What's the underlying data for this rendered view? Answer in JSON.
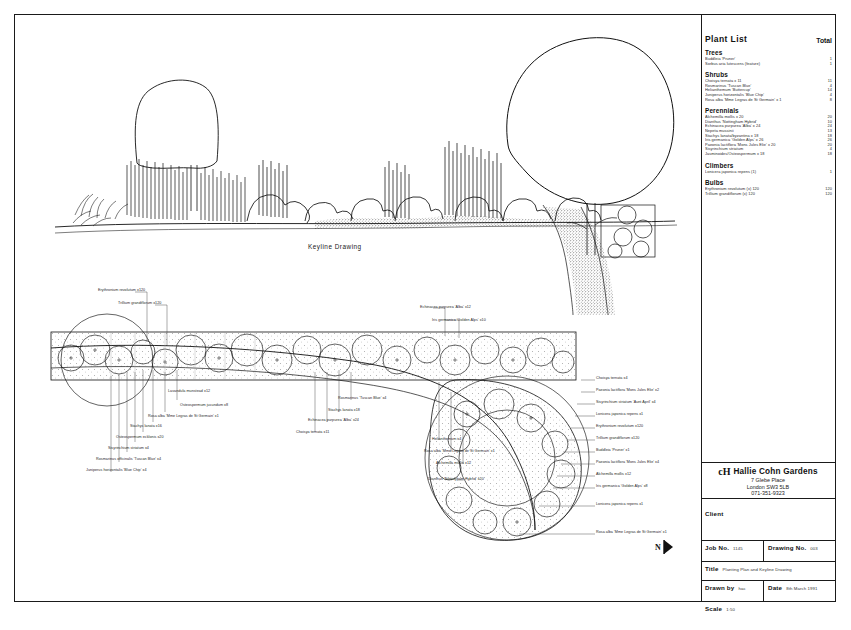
{
  "sheet": {
    "keyline_caption": "Keyline Drawing",
    "bottom_caption": ""
  },
  "plant_list": {
    "title": "Plant List",
    "total_header": "Total",
    "sections": [
      {
        "name": "Trees",
        "rows": [
          {
            "name": "Buddleia 'Pruner'",
            "total": "1"
          },
          {
            "name": "Sorbus aria lutescens (feature)",
            "total": "1"
          }
        ]
      },
      {
        "name": "Shrubs",
        "rows": [
          {
            "name": "Choisya ternata  x 11",
            "total": "11"
          },
          {
            "name": "Rosmarinus 'Tuscan Blue'",
            "total": "4"
          },
          {
            "name": "Helianthemum 'Buttercup'",
            "total": "14"
          },
          {
            "name": "Juniperus horizontalis 'Blue Chip'",
            "total": "4"
          },
          {
            "name": "Rosa alba 'Mme Legras de St Germain' x 1",
            "total": "8"
          }
        ]
      },
      {
        "name": "Perennials",
        "rows": [
          {
            "name": "Alchemilla mollis  x 20",
            "total": "20"
          },
          {
            "name": "Dianthus 'Nottingham Hybrid'",
            "total": "10"
          },
          {
            "name": "Echinacea purpurea 'Alba'  x 24",
            "total": "24"
          },
          {
            "name": "Nepeta mussinii",
            "total": "13"
          },
          {
            "name": "Stachys lanata/byzantina  x 18",
            "total": "18"
          },
          {
            "name": "Iris germanica 'Golden Alps'  x 26",
            "total": "26"
          },
          {
            "name": "Paeonia lactiflora 'Mons Jules Elie'  x 20",
            "total": "20"
          },
          {
            "name": "Sisyrinchium striatum",
            "total": "4"
          },
          {
            "name": "Jasminoides/Osteospermum  x 18",
            "total": "18"
          }
        ]
      },
      {
        "name": "Climbers",
        "rows": [
          {
            "name": "Lonicera japonica repens (1)",
            "total": "1"
          }
        ]
      },
      {
        "name": "Bulbs",
        "rows": [
          {
            "name": "Erythronium revolutum  (x) 120",
            "total": "120"
          },
          {
            "name": "Trillium grandiflorum  (x) 120",
            "total": "120"
          }
        ]
      }
    ]
  },
  "title_block": {
    "company_mark": "cH",
    "company_name": "Hallie Cohn Gardens",
    "address_line1": "7 Glebe Place",
    "address_line2": "London  SW3 5LB",
    "address_line3": "071-351-9323",
    "client_label": "Client",
    "client_value": "",
    "job_no_label": "Job No.",
    "job_no_value": "1145",
    "drawing_no_label": "Drawing No.",
    "drawing_no_value": "003",
    "title_label": "Title",
    "title_value": "Planting Plan and Keyline Drawing",
    "drawn_by_label": "Drawn by",
    "drawn_by_value": "hac",
    "date_label": "Date",
    "date_value": "8th March 1991",
    "scale_label": "Scale",
    "scale_value": "1:50"
  },
  "north_arrow": {
    "label": "N"
  },
  "plan_annotations": [
    {
      "id": "a01",
      "text": "Erythronium revolutum x120",
      "x": 98,
      "y": 288
    },
    {
      "id": "a02",
      "text": "Trillium grandiflorum x120",
      "x": 118,
      "y": 301
    },
    {
      "id": "a03",
      "text": "Echinacea purpurea 'Alba' x12",
      "x": 420,
      "y": 305
    },
    {
      "id": "a04",
      "text": "Iris germanica 'Golden Alps' x10",
      "x": 432,
      "y": 318
    },
    {
      "id": "a05",
      "text": "Lavandula munstead x12",
      "x": 168,
      "y": 389
    },
    {
      "id": "a06",
      "text": "Osteospermum jucundum x8",
      "x": 180,
      "y": 403
    },
    {
      "id": "a07",
      "text": "Rosa alba 'Mme Legras de St Germain' x1",
      "x": 148,
      "y": 414
    },
    {
      "id": "a08",
      "text": "Stachys lanata x16",
      "x": 130,
      "y": 424
    },
    {
      "id": "a09",
      "text": "Osteospermum ecklonis x20",
      "x": 116,
      "y": 435
    },
    {
      "id": "a10",
      "text": "Sisyrinchium striatum x4",
      "x": 108,
      "y": 446
    },
    {
      "id": "a11",
      "text": "Rosmarinus officinalis 'Tuscan Blue' x4",
      "x": 96,
      "y": 457
    },
    {
      "id": "a12",
      "text": "Juniperus horizontalis 'Blue Chip' x4",
      "x": 86,
      "y": 468
    },
    {
      "id": "a13",
      "text": "Rosmarinus 'Tuscan Blue' x4",
      "x": 338,
      "y": 396
    },
    {
      "id": "a14",
      "text": "Stachys lanata x18",
      "x": 328,
      "y": 408
    },
    {
      "id": "a15",
      "text": "Echinacea purpurea 'Alba' x24",
      "x": 308,
      "y": 418
    },
    {
      "id": "a16",
      "text": "Choisya ternata x11",
      "x": 296,
      "y": 430
    },
    {
      "id": "a17",
      "text": "Helianthemum x4",
      "x": 432,
      "y": 437
    },
    {
      "id": "a18",
      "text": "Rosa alba 'Mme Legras de St Germain' x1",
      "x": 424,
      "y": 449
    },
    {
      "id": "a19",
      "text": "Alchemilla mollis x12",
      "x": 436,
      "y": 461
    },
    {
      "id": "a20",
      "text": "Dianthus 'Nottingham Hybrid' x20",
      "x": 428,
      "y": 477
    },
    {
      "id": "a21",
      "text": "Choisya ternata x4",
      "x": 596,
      "y": 376
    },
    {
      "id": "a22",
      "text": "Paeonia lactiflora 'Mons Jules Elie' x2",
      "x": 596,
      "y": 388
    },
    {
      "id": "a23",
      "text": "Sisyrinchium striatum 'Aunt April' x4",
      "x": 596,
      "y": 400
    },
    {
      "id": "a24",
      "text": "Lonicera japonica repens x1",
      "x": 596,
      "y": 412
    },
    {
      "id": "a25",
      "text": "Erythronium revolutum x120",
      "x": 596,
      "y": 424
    },
    {
      "id": "a26",
      "text": "Trillium grandiflorum x120",
      "x": 596,
      "y": 436
    },
    {
      "id": "a27",
      "text": "Buddleia 'Pruner' x1",
      "x": 596,
      "y": 448
    },
    {
      "id": "a28",
      "text": "Paeonia lactiflora 'Mons Jules Elie' x4",
      "x": 596,
      "y": 460
    },
    {
      "id": "a29",
      "text": "Alchemilla mollis x12",
      "x": 596,
      "y": 472
    },
    {
      "id": "a30",
      "text": "Iris germanica 'Golden Alps' x8",
      "x": 596,
      "y": 484
    },
    {
      "id": "a31",
      "text": "Lonicera japonica repens x1",
      "x": 596,
      "y": 502
    },
    {
      "id": "a32",
      "text": "Rosa alba 'Mme Legras de St Germain' x1",
      "x": 596,
      "y": 530
    }
  ]
}
